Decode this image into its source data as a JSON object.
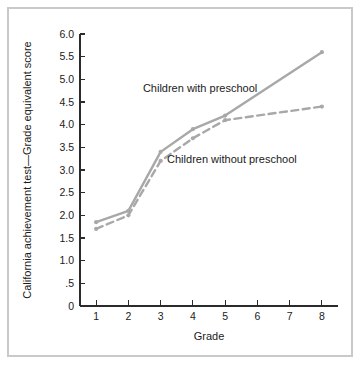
{
  "chart_data": {
    "type": "line",
    "title": "",
    "xlabel": "Grade",
    "ylabel": "California achievement test—Grade equivalent score",
    "x": [
      1,
      2,
      3,
      4,
      5,
      8
    ],
    "categories": [
      "1",
      "2",
      "3",
      "4",
      "5",
      "6",
      "7",
      "8"
    ],
    "xlim": [
      0.5,
      8.5
    ],
    "ylim": [
      0,
      6.0
    ],
    "xticks": [
      1,
      2,
      3,
      4,
      5,
      6,
      7,
      8
    ],
    "xtick_labels": [
      "1",
      "2",
      "3",
      "4",
      "5",
      "6",
      "7",
      "8"
    ],
    "yticks": [
      0,
      0.5,
      1.0,
      1.5,
      2.0,
      2.5,
      3.0,
      3.5,
      4.0,
      4.5,
      5.0,
      5.5,
      6.0
    ],
    "ytick_labels": [
      "0",
      ".5",
      "1.0",
      "1.5",
      "2.0",
      "2.5",
      "3.0",
      "3.5",
      "4.0",
      "4.5",
      "5.0",
      "5.5",
      "6.0"
    ],
    "grid": false,
    "legend_position": "inline-annotations",
    "series": [
      {
        "name": "Children with preschool",
        "style": "solid",
        "color": "#a8a8a8",
        "x": [
          1,
          2,
          3,
          4,
          5,
          8
        ],
        "values": [
          1.85,
          2.1,
          3.4,
          3.9,
          4.2,
          5.6
        ],
        "annotation": "Children with preschool",
        "annotation_x": 2.45,
        "annotation_y": 4.72
      },
      {
        "name": "Children without preschool",
        "style": "dashed",
        "color": "#a8a8a8",
        "x": [
          1,
          2,
          3,
          4,
          5,
          8
        ],
        "values": [
          1.7,
          2.0,
          3.2,
          3.7,
          4.1,
          4.4
        ],
        "annotation": "Children without preschool",
        "annotation_x": 3.2,
        "annotation_y": 3.15
      }
    ]
  },
  "figure": {
    "background_color": "#ffffff",
    "frame_color": "#c9c9c9",
    "axis_color": "#2b2b2b",
    "line_color": "#a8a8a8"
  }
}
